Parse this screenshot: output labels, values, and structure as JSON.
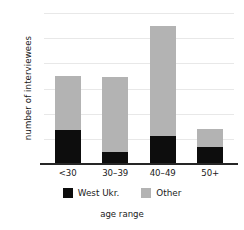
{
  "chart_data": {
    "type": "bar",
    "subtype": "stacked-bar",
    "title": "",
    "xlabel": "age range",
    "ylabel": "number of interviewees",
    "categories": [
      "<30",
      "30–39",
      "40–49",
      "50+"
    ],
    "series": [
      {
        "name": "West Ukr.",
        "color": "#0d0d0d",
        "values": [
          6.7,
          2.4,
          5.5,
          3.4
        ]
      },
      {
        "name": "Other",
        "color": "#b3b3b3",
        "values": [
          10.8,
          14.9,
          21.9,
          3.5
        ]
      }
    ],
    "totals": [
      17.5,
      17.3,
      27.4,
      6.9
    ],
    "ylim": [
      0,
      30
    ],
    "yticks": [
      0,
      5,
      10,
      15,
      20,
      25,
      30
    ],
    "ytick_labels": [
      "0",
      "5",
      "10",
      "15",
      "20",
      "25",
      "30"
    ],
    "grid": true,
    "grid_axis": "y",
    "legend_position": "bottom"
  },
  "axes": {
    "y_title": "number of interviewees",
    "x_title": "age range"
  },
  "legend": {
    "items": [
      {
        "label": "West Ukr.",
        "color": "#0d0d0d",
        "swatch": "black-square-icon"
      },
      {
        "label": "Other",
        "color": "#b3b3b3",
        "swatch": "gray-square-icon"
      }
    ]
  },
  "colors": {
    "west_ukr": "#0d0d0d",
    "other": "#b3b3b3",
    "axis": "#262626",
    "grid": "#e8e8e8",
    "text": "#1a1a1a",
    "background": "#ffffff"
  }
}
